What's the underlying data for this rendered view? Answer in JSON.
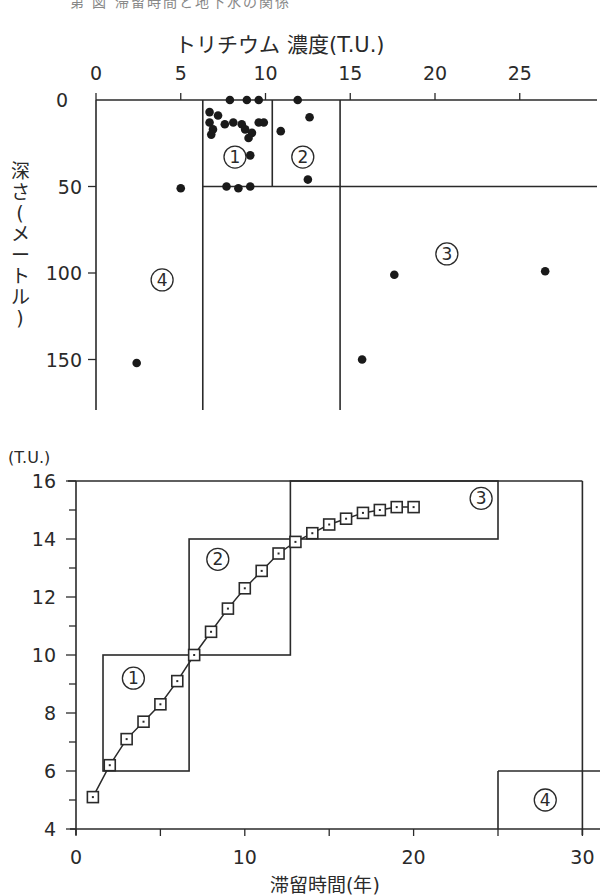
{
  "page": {
    "title_cut": "第 図 滞留時間と地下水の関係"
  },
  "colors": {
    "ink": "#2a2a2a",
    "background": "#ffffff"
  },
  "chart_data": [
    {
      "type": "scatter",
      "title": "トリチウム 濃度(T.U.)",
      "xlabel": "トリチウム 濃度(T.U.)",
      "ylabel": "深さ(メートル)",
      "x_ticks": [
        "0",
        "5",
        "10",
        "15",
        "20",
        "25"
      ],
      "y_ticks": [
        "0",
        "50",
        "100",
        "150"
      ],
      "xlim": [
        0,
        29.5
      ],
      "ylim": [
        0,
        180
      ],
      "y_inverted": true,
      "x_axis_position": "top",
      "regions": [
        {
          "label": "①",
          "x_range": [
            6.3,
            10.4
          ],
          "y_range": [
            0,
            50
          ]
        },
        {
          "label": "②",
          "x_range": [
            10.4,
            14.4
          ],
          "y_range": [
            0,
            50
          ]
        },
        {
          "label": "③",
          "x_range": [
            14.4,
            29.5
          ],
          "y_range": [
            50,
            180
          ]
        },
        {
          "label": "④",
          "x_range": [
            0,
            6.3
          ],
          "y_range": [
            0,
            180
          ]
        }
      ],
      "points": [
        {
          "x": 7.9,
          "y": 0
        },
        {
          "x": 8.9,
          "y": 0
        },
        {
          "x": 9.6,
          "y": 0
        },
        {
          "x": 11.9,
          "y": 0
        },
        {
          "x": 6.7,
          "y": 7
        },
        {
          "x": 7.2,
          "y": 9
        },
        {
          "x": 6.7,
          "y": 13
        },
        {
          "x": 7.6,
          "y": 14
        },
        {
          "x": 8.1,
          "y": 13
        },
        {
          "x": 8.6,
          "y": 14
        },
        {
          "x": 9.6,
          "y": 13
        },
        {
          "x": 9.9,
          "y": 13
        },
        {
          "x": 6.9,
          "y": 17
        },
        {
          "x": 6.8,
          "y": 20
        },
        {
          "x": 8.8,
          "y": 17
        },
        {
          "x": 9.2,
          "y": 19
        },
        {
          "x": 9.0,
          "y": 22
        },
        {
          "x": 9.1,
          "y": 32
        },
        {
          "x": 12.6,
          "y": 10
        },
        {
          "x": 10.9,
          "y": 18
        },
        {
          "x": 12.5,
          "y": 46
        },
        {
          "x": 7.7,
          "y": 50
        },
        {
          "x": 8.4,
          "y": 51
        },
        {
          "x": 9.1,
          "y": 50
        },
        {
          "x": 5.0,
          "y": 51
        },
        {
          "x": 17.6,
          "y": 101
        },
        {
          "x": 26.5,
          "y": 99
        },
        {
          "x": 15.7,
          "y": 150
        },
        {
          "x": 2.4,
          "y": 152
        }
      ],
      "region_label_positions": [
        {
          "label": "①",
          "x": 8.2,
          "y": 33
        },
        {
          "label": "②",
          "x": 12.2,
          "y": 33
        },
        {
          "label": "③",
          "x": 20.7,
          "y": 89
        },
        {
          "label": "④",
          "x": 3.9,
          "y": 104
        }
      ]
    },
    {
      "type": "line",
      "ylabel": "(T.U.)",
      "xlabel": "滞留時間(年)",
      "x_ticks": [
        "0",
        "10",
        "20",
        "30"
      ],
      "y_ticks": [
        "4",
        "6",
        "8",
        "10",
        "12",
        "14",
        "16"
      ],
      "xlim": [
        0,
        31
      ],
      "ylim": [
        4,
        16
      ],
      "marker": "square",
      "series": [
        {
          "name": "トリチウム濃度",
          "x": [
            1,
            2,
            3,
            4,
            5,
            6,
            7,
            8,
            9,
            10,
            11,
            12,
            13,
            14,
            15,
            16,
            17,
            18,
            19,
            20
          ],
          "values": [
            5.1,
            6.2,
            7.1,
            7.7,
            8.3,
            9.1,
            10.0,
            10.8,
            11.6,
            12.3,
            12.9,
            13.5,
            13.9,
            14.2,
            14.5,
            14.7,
            14.9,
            15.0,
            15.1,
            15.1
          ]
        }
      ],
      "regions": [
        {
          "label": "①",
          "x_range": [
            1.6,
            6.7
          ],
          "y_range": [
            6,
            10
          ]
        },
        {
          "label": "②",
          "x_range": [
            6.7,
            12.7
          ],
          "y_range": [
            10,
            14
          ]
        },
        {
          "label": "③",
          "x_range": [
            12.7,
            25
          ],
          "y_range": [
            14,
            16
          ]
        },
        {
          "label": "④",
          "x_range": [
            25,
            31
          ],
          "y_range": [
            4,
            6
          ]
        }
      ],
      "outer_box": {
        "x_range": [
          0,
          30
        ],
        "y_range": [
          6,
          16
        ]
      },
      "region_label_positions": [
        {
          "label": "①",
          "x": 3.4,
          "y": 9.2
        },
        {
          "label": "②",
          "x": 8.4,
          "y": 13.3
        },
        {
          "label": "③",
          "x": 24,
          "y": 15.4
        },
        {
          "label": "④",
          "x": 27.8,
          "y": 5.0
        }
      ]
    }
  ]
}
